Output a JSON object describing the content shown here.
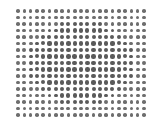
{
  "figure": {
    "grid": {
      "columns": 21,
      "rows": 17,
      "pitch_x": 6.3,
      "pitch_y": 6.5,
      "dot_color": "#5a5a5a",
      "edge_dot_color": "#6e6e6e",
      "background": "#ffffff"
    }
  }
}
